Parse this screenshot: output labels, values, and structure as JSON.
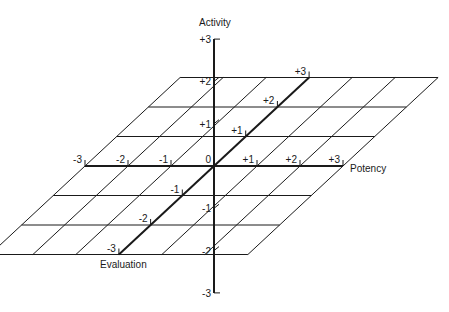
{
  "diagram": {
    "axes": {
      "activity": {
        "label": "Activity",
        "ticks": [
          "+3",
          "+2",
          "+1",
          "-1",
          "-2",
          "-3"
        ],
        "values": [
          3,
          2,
          1,
          -1,
          -2,
          -3
        ]
      },
      "potency": {
        "label": "Potency",
        "ticks": [
          "-3",
          "-2",
          "-1",
          "0",
          "+1",
          "+2",
          "+3"
        ],
        "values": [
          -3,
          -2,
          -1,
          0,
          1,
          2,
          3
        ]
      },
      "evaluation": {
        "label": "Evaluation",
        "ticks": [
          "+3",
          "+2",
          "+1",
          "-1",
          "-2",
          "-3"
        ],
        "values": [
          3,
          2,
          1,
          -1,
          -2,
          -3
        ]
      }
    },
    "grid": {
      "range": [
        -3,
        3
      ]
    }
  }
}
